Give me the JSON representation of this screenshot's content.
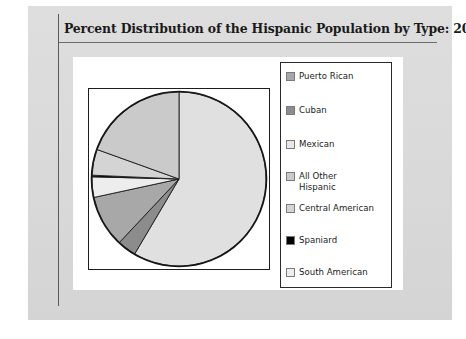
{
  "slide": {
    "title": "Percent Distribution of the Hispanic Population by Type: 2000"
  },
  "colors": {
    "page_background": "#dcdcdc",
    "panel_background": "#ffffff",
    "rule": "#5a5a5a",
    "outline": "#1d1d1d",
    "mexican": "#e0e0e0",
    "puerto_rican": "#a8a8a8",
    "cuban": "#8c8c8c",
    "all_other_hispanic": "#cacaca",
    "central_american": "#d4d4d4",
    "spaniard": "#000000",
    "south_american": "#ededed"
  },
  "legend": {
    "items": [
      {
        "label": "Puerto Rican",
        "swatch": "#a8a8a8",
        "name": "legend-item-puerto-rican"
      },
      {
        "label": "Cuban",
        "swatch": "#8c8c8c",
        "name": "legend-item-cuban"
      },
      {
        "label": "Mexican",
        "swatch": "#e8e8e8",
        "name": "legend-item-mexican"
      },
      {
        "label": "All Other\nHispanic",
        "swatch": "#cacaca",
        "name": "legend-item-all-other-hispanic"
      },
      {
        "label": "Central American",
        "swatch": "#d4d4d4",
        "name": "legend-item-central-american"
      },
      {
        "label": "Spaniard",
        "swatch": "#000000",
        "name": "legend-item-spaniard"
      },
      {
        "label": "South American",
        "swatch": "#ededed",
        "name": "legend-item-south-american"
      }
    ]
  },
  "chart_data": {
    "type": "pie",
    "title": "Percent Distribution of the Hispanic Population by Type: 2000",
    "xlabel": "",
    "ylabel": "",
    "grid": false,
    "legend_position": "right",
    "units": "percent",
    "start_angle_deg": 0,
    "direction": "clockwise",
    "categories": [
      "Mexican",
      "Cuban",
      "Puerto Rican",
      "South American",
      "Spaniard",
      "Central American",
      "All Other Hispanic"
    ],
    "values": [
      58.5,
      3.5,
      9.6,
      3.8,
      0.3,
      4.8,
      19.5
    ],
    "slices": [
      {
        "label": "Mexican",
        "value": 58.5,
        "color": "#e0e0e0"
      },
      {
        "label": "Cuban",
        "value": 3.5,
        "color": "#8c8c8c"
      },
      {
        "label": "Puerto Rican",
        "value": 9.6,
        "color": "#a8a8a8"
      },
      {
        "label": "South American",
        "value": 3.8,
        "color": "#ededed"
      },
      {
        "label": "Spaniard",
        "value": 0.3,
        "color": "#000000"
      },
      {
        "label": "Central American",
        "value": 4.8,
        "color": "#d4d4d4"
      },
      {
        "label": "All Other Hispanic",
        "value": 19.5,
        "color": "#cacaca"
      }
    ]
  }
}
